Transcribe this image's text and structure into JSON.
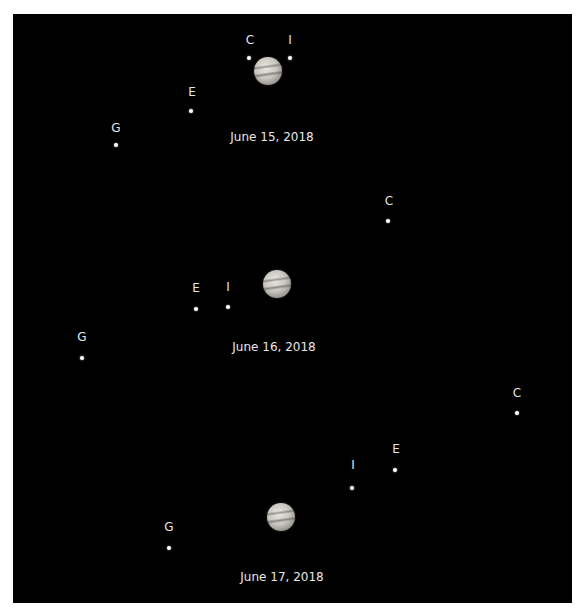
{
  "image": {
    "background_color": "#000000",
    "frame_color": "#ffffff"
  },
  "panels": [
    {
      "date": "June 15, 2018",
      "jupiter": {
        "x": 268,
        "y": 71
      },
      "date_pos": {
        "x": 272,
        "y": 137
      },
      "moons": [
        {
          "label": "C",
          "label_pos": {
            "x": 250,
            "y": 40
          },
          "dot": {
            "x": 249,
            "y": 58
          }
        },
        {
          "label": "I",
          "label_pos": {
            "x": 290,
            "y": 40
          },
          "dot": {
            "x": 290,
            "y": 58
          }
        },
        {
          "label": "E",
          "label_pos": {
            "x": 192,
            "y": 92
          },
          "dot": {
            "x": 191,
            "y": 111
          }
        },
        {
          "label": "G",
          "label_pos": {
            "x": 116,
            "y": 128
          },
          "dot": {
            "x": 116,
            "y": 145
          }
        }
      ]
    },
    {
      "date": "June 16, 2018",
      "jupiter": {
        "x": 277,
        "y": 284
      },
      "date_pos": {
        "x": 274,
        "y": 347
      },
      "moons": [
        {
          "label": "C",
          "label_pos": {
            "x": 389,
            "y": 201
          },
          "dot": {
            "x": 388,
            "y": 221
          }
        },
        {
          "label": "E",
          "label_pos": {
            "x": 196,
            "y": 288
          },
          "dot": {
            "x": 196,
            "y": 309
          }
        },
        {
          "label": "I",
          "label_pos": {
            "x": 228,
            "y": 287
          },
          "dot": {
            "x": 228,
            "y": 307
          }
        },
        {
          "label": "G",
          "label_pos": {
            "x": 82,
            "y": 337
          },
          "dot": {
            "x": 82,
            "y": 358
          }
        }
      ]
    },
    {
      "date": "June 17, 2018",
      "jupiter": {
        "x": 281,
        "y": 517
      },
      "date_pos": {
        "x": 282,
        "y": 577
      },
      "moons": [
        {
          "label": "C",
          "label_pos": {
            "x": 517,
            "y": 393
          },
          "dot": {
            "x": 517,
            "y": 413
          }
        },
        {
          "label": "E",
          "label_pos": {
            "x": 396,
            "y": 449
          },
          "dot": {
            "x": 395,
            "y": 470
          }
        },
        {
          "label": "I",
          "label_pos": {
            "x": 353,
            "y": 465
          },
          "dot": {
            "x": 352,
            "y": 488
          }
        },
        {
          "label": "G",
          "label_pos": {
            "x": 169,
            "y": 527
          },
          "dot": {
            "x": 169,
            "y": 548
          }
        }
      ]
    }
  ]
}
